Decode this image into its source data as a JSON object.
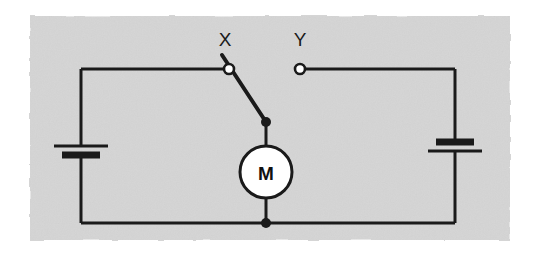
{
  "figure": {
    "kind": "circuit-diagram",
    "background_color": "#ffffff",
    "panel_color": "#d5d5d5",
    "wire_color": "#1a1a1a",
    "panel": {
      "x": 30,
      "y": 16,
      "width": 480,
      "height": 224
    }
  },
  "labels": {
    "terminal_x": "X",
    "terminal_y": "Y",
    "motor": "M"
  },
  "components": {
    "motor": {
      "name": "motor",
      "symbol": "M",
      "center_x": 266,
      "center_y": 172,
      "radius": 26,
      "fill": "#ffffff",
      "stroke": "#1a1a1a"
    },
    "battery_left": {
      "name": "battery-left",
      "x": 81,
      "long_plate_y": 146,
      "short_plate_y": 155,
      "long_plate_half_width": 27,
      "short_plate_half_width": 19,
      "long_plate_thickness": 3,
      "short_plate_thickness": 7
    },
    "battery_right": {
      "name": "battery-right",
      "x": 455,
      "short_plate_y": 142,
      "long_plate_y": 151,
      "long_plate_half_width": 27,
      "short_plate_half_width": 19,
      "long_plate_thickness": 3,
      "short_plate_thickness": 7
    },
    "switch": {
      "name": "changeover-switch",
      "state": "closed-on-X",
      "pivot_x": 229,
      "pivot_y": 69,
      "blade_tip_x": 266,
      "blade_tip_y": 122,
      "blade_top_x": 222,
      "blade_top_y": 55,
      "terminal_radius": 5,
      "terminal_fill": "#ffffff"
    },
    "terminal_y_contact": {
      "name": "terminal-y-contact",
      "cx": 300,
      "cy": 69,
      "radius": 5,
      "fill": "#ffffff"
    }
  },
  "wires": {
    "left_rail_x": 81,
    "right_rail_x": 455,
    "top_rail_y": 69,
    "bottom_rail_y": 223,
    "center_x": 266,
    "stroke_width": 3
  },
  "junctions": [
    {
      "name": "junction-switch-motor",
      "cx": 266,
      "cy": 122,
      "radius": 5
    },
    {
      "name": "junction-motor-bottom",
      "cx": 266,
      "cy": 223,
      "radius": 5
    }
  ],
  "label_positions": {
    "x_label_x": 225,
    "x_label_y": 46,
    "y_label_x": 300,
    "y_label_y": 46
  }
}
